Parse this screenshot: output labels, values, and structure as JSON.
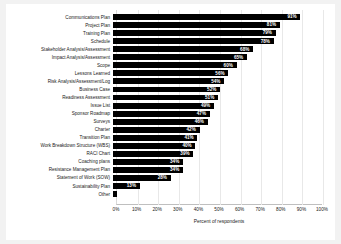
{
  "chart_data": {
    "type": "bar",
    "orientation": "horizontal",
    "title": "",
    "xlabel": "Percent of respondents",
    "ylabel": "",
    "xlim": [
      0,
      100
    ],
    "xticks": [
      "0%",
      "10%",
      "20%",
      "30%",
      "40%",
      "50%",
      "60%",
      "70%",
      "80%",
      "90%",
      "100%"
    ],
    "xtick_values": [
      0,
      10,
      20,
      30,
      40,
      50,
      60,
      70,
      80,
      90,
      100
    ],
    "grid": true,
    "legend": false,
    "bar_color": "#000000",
    "value_label_color": "#ffffff",
    "categories": [
      "Communications Plan",
      "Project Plan",
      "Training Plan",
      "Schedule",
      "Stakeholder Analysis/Assessment",
      "Impact Analysis/Assessment",
      "Scope",
      "Lessons Learned",
      "Risk Analysis/Assessment/Log",
      "Business Case",
      "Readiness Assessment",
      "Issue List",
      "Sponsor Roadmap",
      "Surveys",
      "Charter",
      "Transition Plan",
      "Work Breakdown Structure (WBS)",
      "RACI Chart",
      "Coaching plans",
      "Resistance Management Plan",
      "Statement of Work (SOW)",
      "Sustainability Plan",
      "Other"
    ],
    "values": [
      91,
      81,
      79,
      78,
      68,
      65,
      60,
      56,
      54,
      52,
      51,
      49,
      47,
      46,
      42,
      41,
      40,
      39,
      34,
      34,
      28,
      13,
      2
    ],
    "value_labels": [
      "91%",
      "81%",
      "79%",
      "78%",
      "68%",
      "65%",
      "60%",
      "56%",
      "54%",
      "52%",
      "51%",
      "49%",
      "47%",
      "46%",
      "42%",
      "41%",
      "40%",
      "39%",
      "34%",
      "34%",
      "28%",
      "13%",
      ""
    ]
  }
}
